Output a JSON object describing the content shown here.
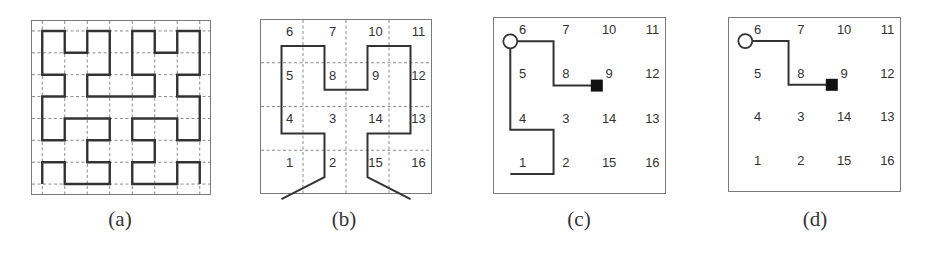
{
  "figure": {
    "panels": [
      {
        "id": "a",
        "caption": "(a)",
        "frame": {
          "x": 31,
          "y": 20,
          "w": 180,
          "h": 175
        },
        "grid": {
          "n": 8,
          "dashed_lines_at": "cell-centers"
        },
        "curve": {
          "type": "hilbert",
          "order": 3,
          "start": "bottom-left",
          "end": "bottom-right"
        },
        "labels": []
      },
      {
        "id": "b",
        "caption": "(b)",
        "frame": {
          "x": 260,
          "y": 19,
          "w": 172,
          "h": 175
        },
        "grid": {
          "n": 4,
          "dashed_lines_at": "cell-boundaries"
        },
        "curve": {
          "type": "hilbert",
          "order": 2,
          "start_tail": "left",
          "end_tail": "right"
        },
        "labels": [
          [
            "6",
            "7",
            "10",
            "11"
          ],
          [
            "5",
            "8",
            "9",
            "12"
          ],
          [
            "4",
            "3",
            "14",
            "13"
          ],
          [
            "1",
            "2",
            "15",
            "16"
          ]
        ]
      },
      {
        "id": "c",
        "caption": "(c)",
        "frame": {
          "x": 493,
          "y": 17,
          "w": 173,
          "h": 177
        },
        "grid": {
          "n": 4,
          "dashed_lines_at": "none"
        },
        "curve": {
          "type": "partial",
          "cells": [
            1,
            2,
            3,
            4,
            5,
            6,
            7,
            8,
            9
          ],
          "start_tail": "left"
        },
        "markers": {
          "circle_at": 6,
          "square_at": 9
        },
        "labels": [
          [
            "6",
            "7",
            "10",
            "11"
          ],
          [
            "5",
            "8",
            "9",
            "12"
          ],
          [
            "4",
            "3",
            "14",
            "13"
          ],
          [
            "1",
            "2",
            "15",
            "16"
          ]
        ]
      },
      {
        "id": "d",
        "caption": "(d)",
        "frame": {
          "x": 728,
          "y": 17,
          "w": 173,
          "h": 175
        },
        "grid": {
          "n": 4,
          "dashed_lines_at": "none"
        },
        "curve": {
          "type": "partial",
          "cells": [
            6,
            7,
            8,
            9
          ]
        },
        "markers": {
          "circle_at": 6,
          "square_at": 9
        },
        "labels": [
          [
            "6",
            "7",
            "10",
            "11"
          ],
          [
            "5",
            "8",
            "9",
            "12"
          ],
          [
            "4",
            "3",
            "14",
            "13"
          ],
          [
            "1",
            "2",
            "15",
            "16"
          ]
        ]
      }
    ],
    "colors": {
      "curve": "#333333",
      "frame": "#7a7a7a",
      "grid": "#8a8a8a",
      "text": "#333333"
    }
  }
}
